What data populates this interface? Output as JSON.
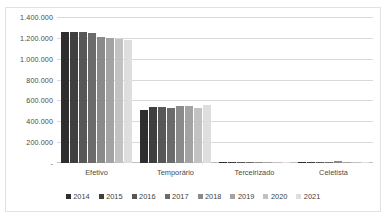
{
  "chart_data": {
    "type": "bar",
    "title": "",
    "subtitle": "",
    "xlabel": "",
    "ylabel": "",
    "categories": [
      "Efetivo",
      "Temporário",
      "Terceirizado",
      "Celetista"
    ],
    "series": [
      {
        "name": "2014",
        "color": "#2e2e2e",
        "values": [
          1252000,
          511000,
          3000,
          7000
        ]
      },
      {
        "name": "2015",
        "color": "#3f3f3f",
        "values": [
          1254000,
          539000,
          3000,
          8000
        ]
      },
      {
        "name": "2016",
        "color": "#575757",
        "values": [
          1256000,
          533000,
          3000,
          9000
        ]
      },
      {
        "name": "2017",
        "color": "#6b6b6b",
        "values": [
          1243000,
          531000,
          3000,
          10000
        ]
      },
      {
        "name": "2018",
        "color": "#8a8a8a",
        "values": [
          1207000,
          551000,
          3000,
          15000
        ]
      },
      {
        "name": "2019",
        "color": "#a3a3a3",
        "values": [
          1197000,
          545000,
          3000,
          14000
        ]
      },
      {
        "name": "2020",
        "color": "#c2c2c2",
        "values": [
          1192000,
          527000,
          3000,
          13000
        ]
      },
      {
        "name": "2021",
        "color": "#dedede",
        "values": [
          1181000,
          556000,
          3000,
          11000
        ]
      }
    ],
    "ylim": [
      0,
      1400000
    ],
    "ytick_values": [
      0,
      200000,
      400000,
      600000,
      800000,
      1000000,
      1200000,
      1400000
    ],
    "ytick_labels": [
      "-",
      "200.000",
      "400.000",
      "600.000",
      "800.000",
      "1.000.000",
      "1.200.000",
      "1.400.000"
    ],
    "grid": true,
    "legend_position": "bottom"
  }
}
